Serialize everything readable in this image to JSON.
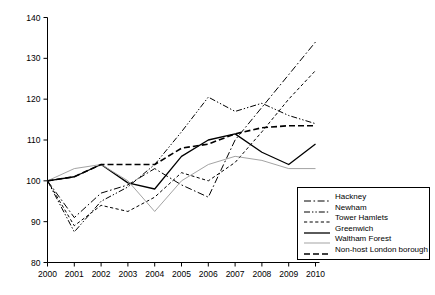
{
  "chart_data": {
    "type": "line",
    "title": "",
    "xlabel": "",
    "ylabel": "",
    "x": [
      2000,
      2001,
      2002,
      2003,
      2004,
      2005,
      2006,
      2007,
      2008,
      2009,
      2010
    ],
    "xtick_labels": [
      "2000",
      "2001",
      "2002",
      "2003",
      "2004",
      "2005",
      "2006",
      "2007",
      "2008",
      "2009",
      "2010"
    ],
    "ytick_labels": [
      "80",
      "90",
      "100",
      "110",
      "120",
      "130",
      "140"
    ],
    "yticks": [
      80,
      90,
      100,
      110,
      120,
      130,
      140
    ],
    "xlim": [
      2000,
      2010
    ],
    "ylim": [
      80,
      140
    ],
    "grid": false,
    "legend_position": "lower-right",
    "series": [
      {
        "name": "Hackney",
        "style": "dash-dot",
        "color": "#000000",
        "values": [
          100,
          91,
          97,
          99,
          103,
          99,
          96,
          110,
          118,
          126,
          134
        ]
      },
      {
        "name": "Newham",
        "style": "dash-dot-dot",
        "color": "#000000",
        "values": [
          100,
          87.5,
          95,
          98.5,
          104,
          112,
          120.5,
          117,
          119,
          116,
          114
        ]
      },
      {
        "name": "Tower Hamlets",
        "style": "dashed-fine",
        "color": "#000000",
        "values": [
          100,
          89,
          94,
          92.5,
          96,
          102,
          100,
          104.5,
          112,
          120,
          127
        ]
      },
      {
        "name": "Greenwich",
        "style": "solid",
        "color": "#000000",
        "values": [
          100,
          101,
          104,
          99.5,
          98,
          106,
          110,
          111.5,
          107,
          104,
          109
        ]
      },
      {
        "name": "Waltham Forest",
        "style": "solid-thin-grey",
        "color": "#999999",
        "values": [
          100,
          103,
          104,
          100,
          92.5,
          100,
          104,
          106,
          105,
          103,
          103
        ]
      },
      {
        "name": "Non-host London borough",
        "style": "dashed-thick",
        "color": "#000000",
        "values": [
          100,
          101,
          104,
          104,
          104,
          108,
          109,
          111.5,
          113,
          113.5,
          113.5
        ]
      }
    ]
  }
}
